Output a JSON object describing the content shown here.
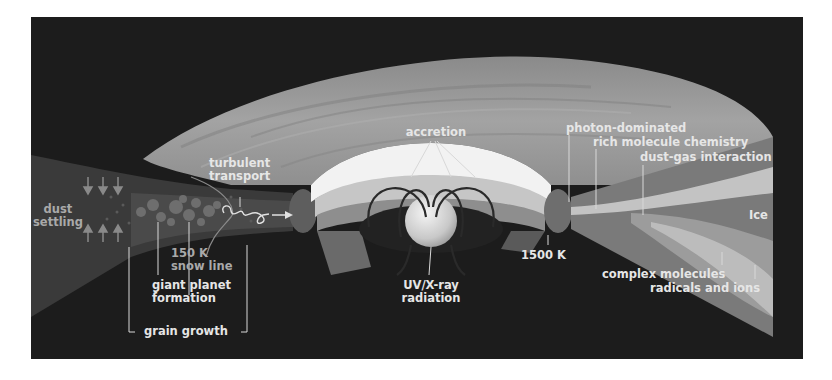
{
  "figure": {
    "colors": {
      "background": "#1c1c1c",
      "disk_surface": "#9a9a9a",
      "inner_rim": "#f2f2f2",
      "label": "#e6e6e6",
      "label_dim": "#a9a9a9"
    }
  },
  "labels": {
    "accretion": "accretion",
    "turbulent_transport": [
      "turbulent",
      "transport"
    ],
    "dust_settling": [
      "dust",
      "settling"
    ],
    "snow_line": [
      "150 K",
      "snow line"
    ],
    "giant_planet_formation": [
      "giant planet",
      "formation"
    ],
    "grain_growth": "grain growth",
    "uv_xray_radiation": [
      "UV/X-ray",
      "radiation"
    ],
    "inner_rim_temp": "1500 K",
    "photon_dominated": "photon-dominated",
    "rich_molecule_chemistry": "rich molecule chemistry",
    "dust_gas_interaction": "dust-gas interaction",
    "ice": "Ice",
    "complex_molecules": "complex molecules",
    "radicals_and_ions": "radicals and ions"
  }
}
